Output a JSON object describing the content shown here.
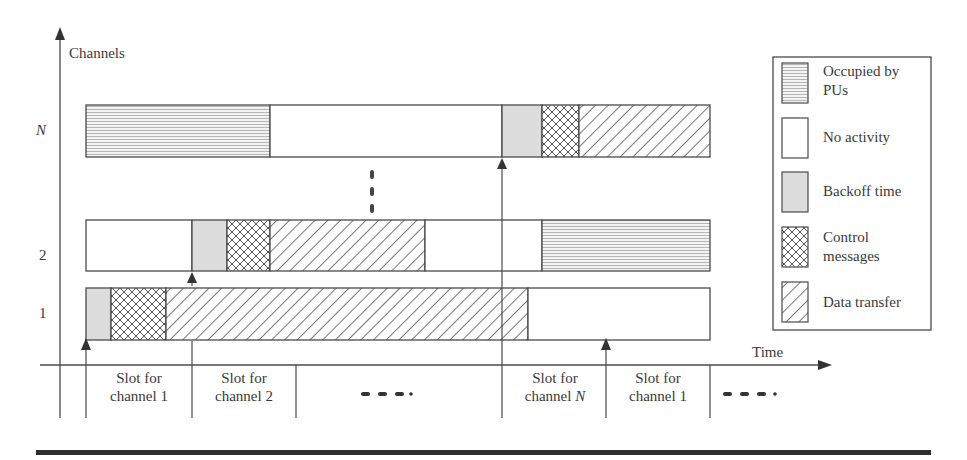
{
  "axes": {
    "y_label": "Channels",
    "x_label": "Time",
    "channel_labels": [
      "N",
      "2",
      "1"
    ]
  },
  "rows": [
    {
      "channel": "N",
      "segments": [
        {
          "type": "occupied",
          "x0": 86,
          "x1": 270
        },
        {
          "type": "none",
          "x0": 270,
          "x1": 502
        },
        {
          "type": "backoff",
          "x0": 502,
          "x1": 542
        },
        {
          "type": "control",
          "x0": 542,
          "x1": 579
        },
        {
          "type": "data",
          "x0": 579,
          "x1": 710
        }
      ]
    },
    {
      "channel": "2",
      "segments": [
        {
          "type": "none",
          "x0": 86,
          "x1": 192
        },
        {
          "type": "backoff",
          "x0": 192,
          "x1": 227
        },
        {
          "type": "control",
          "x0": 227,
          "x1": 270
        },
        {
          "type": "data",
          "x0": 270,
          "x1": 425
        },
        {
          "type": "none",
          "x0": 425,
          "x1": 542
        },
        {
          "type": "occupied",
          "x0": 542,
          "x1": 710
        }
      ]
    },
    {
      "channel": "1",
      "segments": [
        {
          "type": "backoff",
          "x0": 86,
          "x1": 111
        },
        {
          "type": "control",
          "x0": 111,
          "x1": 166
        },
        {
          "type": "data",
          "x0": 166,
          "x1": 528
        },
        {
          "type": "none",
          "x0": 528,
          "x1": 710
        }
      ]
    }
  ],
  "slots": [
    {
      "line1": "Slot for",
      "line2": "channel 1",
      "italic_suffix": ""
    },
    {
      "line1": "Slot for",
      "line2": "channel 2",
      "italic_suffix": ""
    },
    {
      "line1": "Slot for",
      "line2": "channel ",
      "italic_suffix": "N"
    },
    {
      "line1": "Slot for",
      "line2": "channel 1",
      "italic_suffix": ""
    }
  ],
  "ellipsis": "- - - .",
  "legend": [
    {
      "type": "occupied",
      "line1": "Occupied by",
      "line2": "PUs"
    },
    {
      "type": "none",
      "line1": "No activity",
      "line2": ""
    },
    {
      "type": "backoff",
      "line1": "Backoff time",
      "line2": ""
    },
    {
      "type": "control",
      "line1": "Control",
      "line2": "messages"
    },
    {
      "type": "data",
      "line1": "Data transfer",
      "line2": ""
    }
  ],
  "colors": {
    "stroke": "#4a4a4a",
    "backoff_fill": "#dcdcdc",
    "occupied_line": "#b5b5b5",
    "hatch": "#555555",
    "rule": "#2e2e2e"
  }
}
